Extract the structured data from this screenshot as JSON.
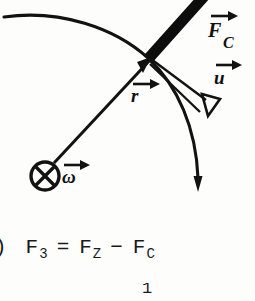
{
  "figure": {
    "background_color": "#fdfdfb",
    "ink_color": "#111111",
    "labels": {
      "force_c": "F",
      "force_c_subscript": "C",
      "velocity": "u",
      "radius": "r",
      "omega": "ω",
      "rotation_symbol": "⊗"
    },
    "vectors": [
      {
        "name": "F_C",
        "label": "F",
        "subscript": "C",
        "style": "thick-solid",
        "arrowhead": "filled"
      },
      {
        "name": "u",
        "label": "u",
        "style": "thin-solid",
        "arrowhead": "open-triangle"
      },
      {
        "name": "r",
        "label": "r",
        "style": "thin-solid",
        "arrowhead": "filled"
      },
      {
        "name": "omega",
        "label": "ω",
        "style": "thin-solid",
        "arrowhead": "filled"
      }
    ],
    "arc": {
      "name": "trajectory-arc",
      "arrowhead": "filled-down"
    }
  },
  "equation": {
    "paren": ")",
    "lhs": "F",
    "lhs_sub": "3",
    "eq": "=",
    "term1": "F",
    "term1_sub": "Z",
    "op": "−",
    "term2": "F",
    "term2_sub": "C"
  },
  "partial_row": {
    "fragment_one": "1"
  }
}
